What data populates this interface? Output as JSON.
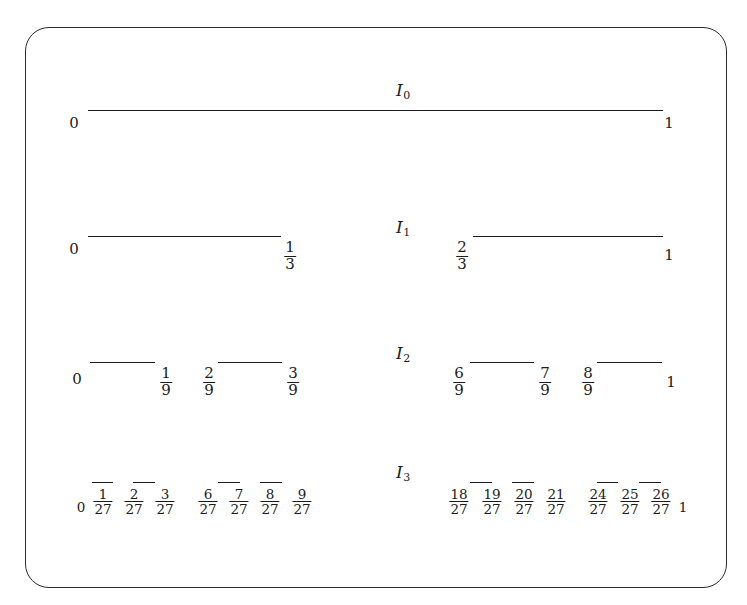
{
  "figure": {
    "type": "cantor-set-construction",
    "caption": "",
    "background_color": "#ffffff",
    "line_color": "#1b1b1b",
    "frame_color": "#2b2b2b"
  },
  "rows": [
    {
      "id": "I0",
      "label": "I",
      "label_sub": "0",
      "label_x": 396,
      "label_y": 80,
      "segment_y": 110,
      "segments": [
        {
          "x1": 88,
          "x2": 663
        }
      ],
      "ticks": [
        {
          "text": "0",
          "kind": "int",
          "x": 74,
          "y": 116
        },
        {
          "text": "1",
          "kind": "int",
          "x": 669,
          "y": 116
        }
      ]
    },
    {
      "id": "I1",
      "label": "I",
      "label_sub": "1",
      "label_x": 396,
      "label_y": 217,
      "segment_y": 236,
      "segments": [
        {
          "x1": 88,
          "x2": 281
        },
        {
          "x1": 473,
          "x2": 663
        }
      ],
      "ticks": [
        {
          "text": "0",
          "kind": "int",
          "x": 74,
          "y": 242
        },
        {
          "num": "1",
          "den": "3",
          "kind": "frac",
          "x": 290,
          "y": 240
        },
        {
          "num": "2",
          "den": "3",
          "kind": "frac",
          "x": 462,
          "y": 240
        },
        {
          "text": "1",
          "kind": "int",
          "x": 669,
          "y": 248
        }
      ]
    },
    {
      "id": "I2",
      "label": "I",
      "label_sub": "2",
      "label_x": 396,
      "label_y": 343,
      "segment_y": 362,
      "segments": [
        {
          "x1": 90,
          "x2": 155
        },
        {
          "x1": 218,
          "x2": 282
        },
        {
          "x1": 470,
          "x2": 534
        },
        {
          "x1": 597,
          "x2": 662
        },
        {
          "x1": 470,
          "x2": 534
        }
      ],
      "ticks": [
        {
          "text": "0",
          "kind": "int",
          "x": 77,
          "y": 372
        },
        {
          "num": "1",
          "den": "9",
          "kind": "frac",
          "x": 166,
          "y": 366
        },
        {
          "num": "2",
          "den": "9",
          "kind": "frac",
          "x": 209,
          "y": 366
        },
        {
          "num": "3",
          "den": "9",
          "kind": "frac",
          "x": 293,
          "y": 366
        },
        {
          "num": "6",
          "den": "9",
          "kind": "frac",
          "x": 459,
          "y": 366
        },
        {
          "num": "7",
          "den": "9",
          "kind": "frac",
          "x": 545,
          "y": 366
        },
        {
          "num": "8",
          "den": "9",
          "kind": "frac",
          "x": 588,
          "y": 366
        },
        {
          "text": "1",
          "kind": "int",
          "x": 671,
          "y": 375
        }
      ]
    },
    {
      "id": "I3",
      "label": "I",
      "label_sub": "3",
      "label_x": 396,
      "label_y": 462,
      "segment_y": 482,
      "segments": [
        {
          "x1": 92,
          "x2": 113
        },
        {
          "x1": 133,
          "x2": 155
        },
        {
          "x1": 218,
          "x2": 240
        },
        {
          "x1": 260,
          "x2": 282
        },
        {
          "x1": 470,
          "x2": 492
        },
        {
          "x1": 512,
          "x2": 534
        },
        {
          "x1": 597,
          "x2": 618
        },
        {
          "x1": 639,
          "x2": 661
        }
      ],
      "ticks": [
        {
          "text": "0",
          "kind": "int",
          "x": 81,
          "y": 500
        },
        {
          "num": "1",
          "den": "27",
          "kind": "frac",
          "x": 103,
          "y": 487
        },
        {
          "num": "2",
          "den": "27",
          "kind": "frac",
          "x": 134,
          "y": 487
        },
        {
          "num": "3",
          "den": "27",
          "kind": "frac",
          "x": 165,
          "y": 487
        },
        {
          "num": "6",
          "den": "27",
          "kind": "frac",
          "x": 208,
          "y": 487
        },
        {
          "num": "7",
          "den": "27",
          "kind": "frac",
          "x": 239,
          "y": 487
        },
        {
          "num": "8",
          "den": "27",
          "kind": "frac",
          "x": 270,
          "y": 487
        },
        {
          "num": "9",
          "den": "27",
          "kind": "frac",
          "x": 302,
          "y": 487
        },
        {
          "num": "18",
          "den": "27",
          "kind": "frac",
          "x": 459,
          "y": 487
        },
        {
          "num": "19",
          "den": "27",
          "kind": "frac",
          "x": 492,
          "y": 487
        },
        {
          "num": "20",
          "den": "27",
          "kind": "frac",
          "x": 524,
          "y": 487
        },
        {
          "num": "21",
          "den": "27",
          "kind": "frac",
          "x": 556,
          "y": 487
        },
        {
          "num": "24",
          "den": "27",
          "kind": "frac",
          "x": 598,
          "y": 487
        },
        {
          "num": "25",
          "den": "27",
          "kind": "frac",
          "x": 630,
          "y": 487
        },
        {
          "num": "26",
          "den": "27",
          "kind": "frac",
          "x": 661,
          "y": 487
        },
        {
          "text": "1",
          "kind": "int",
          "x": 683,
          "y": 500
        }
      ]
    }
  ],
  "chart_data": {
    "type": "line",
    "xlabel": "",
    "ylabel": "",
    "xlim": [
      0,
      1
    ],
    "grid": false,
    "legend": "none",
    "series": [
      {
        "name": "I0",
        "intervals": [
          [
            0,
            1
          ]
        ]
      },
      {
        "name": "I1",
        "intervals": [
          [
            0,
            0.3333333
          ],
          [
            0.6666667,
            1
          ]
        ]
      },
      {
        "name": "I2",
        "intervals": [
          [
            0,
            0.1111111
          ],
          [
            0.2222222,
            0.3333333
          ],
          [
            0.6666667,
            0.7777778
          ],
          [
            0.8888889,
            1
          ]
        ]
      },
      {
        "name": "I3",
        "intervals": [
          [
            0,
            0.037037
          ],
          [
            0.0740741,
            0.1111111
          ],
          [
            0.2222222,
            0.2592593
          ],
          [
            0.2962963,
            0.3333333
          ],
          [
            0.6666667,
            0.7037037
          ],
          [
            0.7407407,
            0.7777778
          ],
          [
            0.8888889,
            0.9259259
          ],
          [
            0.962963,
            1
          ]
        ]
      }
    ],
    "tick_labels": {
      "I0": [
        "0",
        "1"
      ],
      "I1": [
        "0",
        "1/3",
        "2/3",
        "1"
      ],
      "I2": [
        "0",
        "1/9",
        "2/9",
        "3/9",
        "6/9",
        "7/9",
        "8/9",
        "1"
      ],
      "I3": [
        "0",
        "1/27",
        "2/27",
        "3/27",
        "6/27",
        "7/27",
        "8/27",
        "9/27",
        "18/27",
        "19/27",
        "20/27",
        "21/27",
        "24/27",
        "25/27",
        "26/27",
        "1"
      ]
    }
  }
}
